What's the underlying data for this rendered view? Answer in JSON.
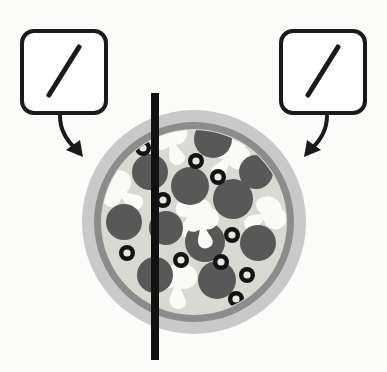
{
  "figure": {
    "title": "Pizza divided by a vertical line with two identical slash callouts",
    "background_color": "#fbfbfa"
  },
  "callouts": [
    {
      "id": "left-callout",
      "label": "left-slash-card",
      "symbol": "slash",
      "symbol_text": "/",
      "box": {
        "x": 22,
        "y": 31,
        "width": 84,
        "height": 82,
        "radius": 12
      },
      "border_color": "#1a1a1a",
      "fill_color": "#ffffff",
      "border_width": 4,
      "mark": {
        "x1": 49,
        "y1": 95,
        "x2": 79,
        "y2": 47,
        "width": 5,
        "color": "#1a1a1a"
      },
      "arrow": {
        "id": "left-arrow",
        "path": "M 60 116 C 60 131, 70 142, 79 151",
        "head_points": "79,153 68,146 84,141",
        "color": "#1a1a1a",
        "width": 4
      }
    },
    {
      "id": "right-callout",
      "label": "right-slash-card",
      "symbol": "slash",
      "symbol_text": "/",
      "box": {
        "x": 281,
        "y": 31,
        "width": 84,
        "height": 82,
        "radius": 12
      },
      "border_color": "#1a1a1a",
      "fill_color": "#ffffff",
      "border_width": 4,
      "mark": {
        "x1": 308,
        "y1": 95,
        "x2": 338,
        "y2": 47,
        "width": 5,
        "color": "#1a1a1a"
      },
      "arrow": {
        "id": "right-arrow",
        "path": "M 327 116 C 327 131, 317 142, 308 151",
        "head_points": "307,153 318,146, 302,141",
        "color": "#1a1a1a",
        "width": 4
      }
    }
  ],
  "pizza": {
    "label": "pizza",
    "center": {
      "cx": 194,
      "cy": 222
    },
    "shadow": {
      "r": 112,
      "color": "#c9c9c9"
    },
    "crust_outer": {
      "r": 100,
      "color": "#8c8c8c"
    },
    "crust_inner": {
      "r": 93,
      "color": "#d6d6d2"
    },
    "cheese": {
      "r": 93,
      "color": "#d9d9d4"
    },
    "colors": {
      "shadow": "#c9c9c9",
      "crust": "#8c8c8c",
      "cheese": "#d9d9d4",
      "pepperoni": "#585858",
      "olive": "#131313",
      "olive_center": "#e8e8e4",
      "mushroom": "#fafaf7",
      "divider": "#111111"
    },
    "divider_line": {
      "label": "vertical-cut-line",
      "x": 155,
      "y_top": 93,
      "y_bottom": 360,
      "width": 8,
      "color": "#111111"
    },
    "pepperoni": [
      {
        "cx": 213,
        "cy": 139,
        "r": 19
      },
      {
        "cx": 150,
        "cy": 172,
        "r": 18
      },
      {
        "cx": 190,
        "cy": 186,
        "r": 19
      },
      {
        "cx": 256,
        "cy": 172,
        "r": 17
      },
      {
        "cx": 233,
        "cy": 199,
        "r": 20
      },
      {
        "cx": 124,
        "cy": 222,
        "r": 18
      },
      {
        "cx": 166,
        "cy": 228,
        "r": 17
      },
      {
        "cx": 205,
        "cy": 242,
        "r": 20
      },
      {
        "cx": 258,
        "cy": 243,
        "r": 18
      },
      {
        "cx": 155,
        "cy": 275,
        "r": 18
      },
      {
        "cx": 217,
        "cy": 280,
        "r": 19
      }
    ],
    "olives": [
      {
        "cx": 143,
        "cy": 148,
        "r": 8,
        "ri": 3.6
      },
      {
        "cx": 196,
        "cy": 161,
        "r": 8,
        "ri": 3.6
      },
      {
        "cx": 218,
        "cy": 177,
        "r": 8,
        "ri": 3.6
      },
      {
        "cx": 163,
        "cy": 200,
        "r": 8,
        "ri": 3.6
      },
      {
        "cx": 232,
        "cy": 235,
        "r": 8,
        "ri": 3.6
      },
      {
        "cx": 127,
        "cy": 253,
        "r": 8,
        "ri": 3.6
      },
      {
        "cx": 181,
        "cy": 260,
        "r": 8,
        "ri": 3.6
      },
      {
        "cx": 221,
        "cy": 262,
        "r": 8,
        "ri": 3.6
      },
      {
        "cx": 247,
        "cy": 275,
        "r": 8,
        "ri": 3.6
      },
      {
        "cx": 236,
        "cy": 299,
        "r": 8,
        "ri": 3.6
      }
    ],
    "mushrooms": [
      {
        "cx": 172,
        "cy": 143,
        "rot": -20,
        "scale": 1.0
      },
      {
        "cx": 228,
        "cy": 160,
        "rot": 35,
        "scale": 1.05
      },
      {
        "cx": 122,
        "cy": 193,
        "rot": -55,
        "scale": 1.05
      },
      {
        "cx": 192,
        "cy": 216,
        "rot": 15,
        "scale": 1.0
      },
      {
        "cx": 265,
        "cy": 216,
        "rot": 60,
        "scale": 1.0
      },
      {
        "cx": 178,
        "cy": 285,
        "rot": 0,
        "scale": 1.05
      }
    ]
  }
}
